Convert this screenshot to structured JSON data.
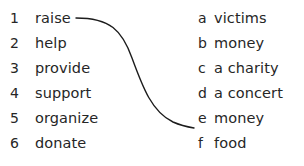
{
  "exercise": {
    "type": "matching",
    "left_column": {
      "items": [
        {
          "marker": "1",
          "text": "raise"
        },
        {
          "marker": "2",
          "text": "help"
        },
        {
          "marker": "3",
          "text": "provide"
        },
        {
          "marker": "4",
          "text": "support"
        },
        {
          "marker": "5",
          "text": "organize"
        },
        {
          "marker": "6",
          "text": "donate"
        }
      ]
    },
    "right_column": {
      "items": [
        {
          "marker": "a",
          "text": "victims"
        },
        {
          "marker": "b",
          "text": "money"
        },
        {
          "marker": "c",
          "text": "a charity"
        },
        {
          "marker": "d",
          "text": "a concert"
        },
        {
          "marker": "e",
          "text": "money"
        },
        {
          "marker": "f",
          "text": "food"
        }
      ]
    },
    "connections": [
      {
        "from": "1",
        "to": "e",
        "path": "M 76 18 C 110 18 122 30 132 58 C 143 88 152 112 173 122 C 182 126 188 127 194 128"
      }
    ],
    "colors": {
      "text": "#262626",
      "line": "#1c1c1c",
      "background": "#ffffff"
    }
  }
}
